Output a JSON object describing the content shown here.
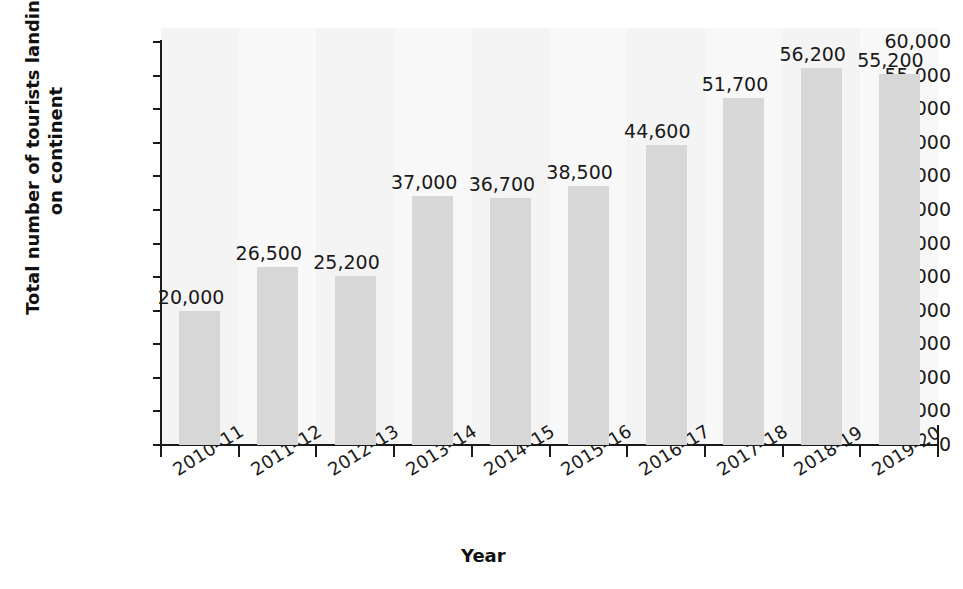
{
  "chart_data": {
    "type": "bar",
    "title": "",
    "xlabel": "Year",
    "ylabel": "Total number of tourists landing on continent",
    "ylabel_line1": "Total number of tourists landing",
    "ylabel_line2": "on continent",
    "categories": [
      "2010–11",
      "2011–12",
      "2012–13",
      "2013–14",
      "2014–15",
      "2015–16",
      "2016–17",
      "2017–18",
      "2018-19",
      "2019-20"
    ],
    "values": [
      20000,
      26500,
      25200,
      37000,
      36700,
      38500,
      44600,
      51700,
      56200,
      55200
    ],
    "value_labels": [
      "20,000",
      "26,500",
      "25,200",
      "37,000",
      "36,700",
      "38,500",
      "44,600",
      "51,700",
      "56,200",
      "55,200"
    ],
    "ylim": [
      0,
      60000
    ],
    "ytick_values": [
      0,
      5000,
      10000,
      15000,
      20000,
      25000,
      30000,
      35000,
      40000,
      45000,
      50000,
      55000,
      60000
    ],
    "ytick_labels": [
      "0",
      "5,000",
      "10,000",
      "15,000",
      "20,000",
      "25,000",
      "30,000",
      "35,000",
      "40,000",
      "45,000",
      "50,000",
      "55,000",
      "60,000"
    ],
    "grid": false,
    "legend": "none",
    "bar_color": "#d7d7d7",
    "text_color": "#1a1a1a",
    "plot_background": "#f6f6f6"
  }
}
